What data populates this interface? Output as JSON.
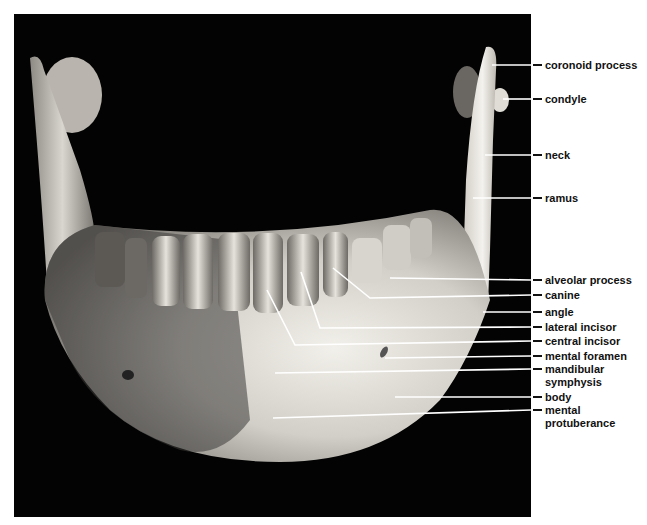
{
  "figure": {
    "labels": [
      {
        "id": "coronoid-process",
        "text": "coronoid process",
        "y": 65,
        "leader": [
          [
            492,
            65
          ]
        ]
      },
      {
        "id": "condyle",
        "text": "condyle",
        "y": 99,
        "leader": [
          [
            503,
            99
          ]
        ]
      },
      {
        "id": "neck",
        "text": "neck",
        "y": 155,
        "leader": [
          [
            485,
            155
          ]
        ]
      },
      {
        "id": "ramus",
        "text": "ramus",
        "y": 198,
        "leader": [
          [
            473,
            198
          ]
        ]
      },
      {
        "id": "alveolar-process",
        "text": "alveolar process",
        "y": 280,
        "leader": [
          [
            390,
            278
          ]
        ]
      },
      {
        "id": "canine",
        "text": "canine",
        "y": 295,
        "leader": [
          [
            333,
            268
          ],
          [
            370,
            298
          ]
        ]
      },
      {
        "id": "angle",
        "text": "angle",
        "y": 312,
        "leader": [
          [
            483,
            312
          ]
        ]
      },
      {
        "id": "lateral-incisor",
        "text": "lateral incisor",
        "y": 327,
        "leader": [
          [
            301,
            272
          ],
          [
            320,
            328
          ]
        ]
      },
      {
        "id": "central-incisor",
        "text": "central incisor",
        "y": 341,
        "leader": [
          [
            267,
            290
          ],
          [
            295,
            345
          ]
        ]
      },
      {
        "id": "mental-foramen",
        "text": "mental foramen",
        "y": 356,
        "leader": [
          [
            385,
            358
          ]
        ]
      },
      {
        "id": "mandibular-symphysis",
        "text": "mandibular",
        "text2": "symphysis",
        "y": 369,
        "leader": [
          [
            275,
            373
          ]
        ]
      },
      {
        "id": "body",
        "text": "body",
        "y": 397,
        "leader": [
          [
            395,
            397
          ]
        ]
      },
      {
        "id": "mental-protuberance",
        "text": "mental",
        "text2": "protuberance",
        "y": 410,
        "leader": [
          [
            273,
            418
          ]
        ]
      }
    ]
  }
}
